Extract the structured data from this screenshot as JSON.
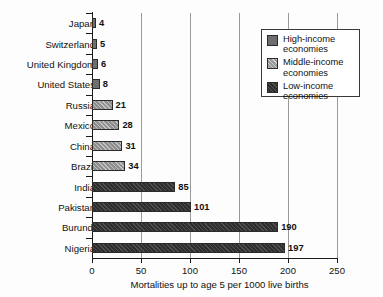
{
  "chart_data": {
    "type": "bar",
    "orientation": "horizontal",
    "title": "",
    "xlabel": "Mortalities up to age 5 per 1000 live births",
    "ylabel": "",
    "xlim": [
      0,
      250
    ],
    "xticks": [
      0,
      50,
      100,
      150,
      200,
      250
    ],
    "grid": "vertical",
    "legend_position": "top-right",
    "categories": [
      "Japan",
      "Switzerland",
      "United Kingdom",
      "United States",
      "Russia",
      "Mexico",
      "China",
      "Brazil",
      "India",
      "Pakistan",
      "Burundi",
      "Nigeria"
    ],
    "values": [
      4,
      5,
      6,
      8,
      21,
      28,
      31,
      34,
      85,
      101,
      190,
      197
    ],
    "groups": [
      "high",
      "high",
      "high",
      "high",
      "middle",
      "middle",
      "middle",
      "middle",
      "low",
      "low",
      "low",
      "low"
    ],
    "series": [
      {
        "name": "High-income economies",
        "key": "high",
        "color": "#6e6e6e",
        "points": [
          {
            "category": "Japan",
            "value": 4
          },
          {
            "category": "Switzerland",
            "value": 5
          },
          {
            "category": "United Kingdom",
            "value": 6
          },
          {
            "category": "United States",
            "value": 8
          }
        ]
      },
      {
        "name": "Middle-income economies",
        "key": "middle",
        "color": "#9a9a9a",
        "points": [
          {
            "category": "Russia",
            "value": 21
          },
          {
            "category": "Mexico",
            "value": 28
          },
          {
            "category": "China",
            "value": 31
          },
          {
            "category": "Brazil",
            "value": 34
          }
        ]
      },
      {
        "name": "Low-income economies",
        "key": "low",
        "color": "#2e2e2e",
        "points": [
          {
            "category": "India",
            "value": 85
          },
          {
            "category": "Pakistan",
            "value": 101
          },
          {
            "category": "Burundi",
            "value": 190
          },
          {
            "category": "Nigeria",
            "value": 197
          }
        ]
      }
    ],
    "bars": [
      {
        "category": "Japan",
        "value": 4,
        "label": "4",
        "group": "high"
      },
      {
        "category": "Switzerland",
        "value": 5,
        "label": "5",
        "group": "high"
      },
      {
        "category": "United Kingdom",
        "value": 6,
        "label": "6",
        "group": "high"
      },
      {
        "category": "United States",
        "value": 8,
        "label": "8",
        "group": "high"
      },
      {
        "category": "Russia",
        "value": 21,
        "label": "21",
        "group": "middle"
      },
      {
        "category": "Mexico",
        "value": 28,
        "label": "28",
        "group": "middle"
      },
      {
        "category": "China",
        "value": 31,
        "label": "31",
        "group": "middle"
      },
      {
        "category": "Brazil",
        "value": 34,
        "label": "34",
        "group": "middle"
      },
      {
        "category": "India",
        "value": 85,
        "label": "85",
        "group": "low"
      },
      {
        "category": "Pakistan",
        "value": 101,
        "label": "101",
        "group": "low"
      },
      {
        "category": "Burundi",
        "value": 190,
        "label": "190",
        "group": "low"
      },
      {
        "category": "Nigeria",
        "value": 197,
        "label": "197",
        "group": "low"
      }
    ],
    "tick_labels": [
      "0",
      "50",
      "100",
      "150",
      "200",
      "250"
    ],
    "legend": [
      {
        "label": "High-income\neconomies",
        "line1": "High-income",
        "line2": "economies",
        "key": "high"
      },
      {
        "label": "Middle-income\neconomies",
        "line1": "Middle-income",
        "line2": "economies",
        "key": "middle"
      },
      {
        "label": "Low-income\neconomies",
        "line1": "Low-income",
        "line2": "economies",
        "key": "low"
      }
    ]
  }
}
